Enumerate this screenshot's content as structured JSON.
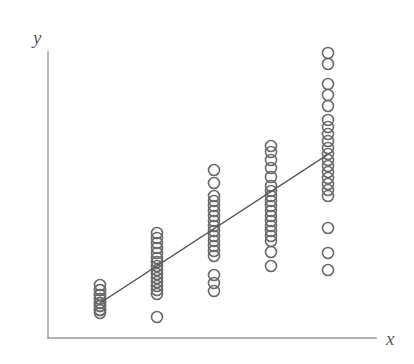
{
  "chart_data": {
    "type": "scatter",
    "title": "",
    "subtitle": "",
    "xlabel": "x",
    "ylabel": "y",
    "grid": false,
    "legend": null,
    "xlim": [
      0,
      6
    ],
    "ylim": [
      0,
      10
    ],
    "axis_ticks": {
      "x": [],
      "y": []
    },
    "marker": {
      "shape": "open-circle",
      "diameter_px": 11,
      "stroke_color": "#6b6b6b",
      "stroke_width_px": 1.6,
      "fill": "none"
    },
    "series": [
      {
        "name": "observations",
        "note": "Five vertical clusters of repeated x values with spread in y; many markers overlap.",
        "x": [
          1,
          2,
          3,
          4,
          5
        ],
        "clusters": [
          {
            "x": 1,
            "x_px": 100,
            "count": 14,
            "y_px": [
              285,
              290,
              290,
              295,
              295,
              299,
              299,
              303,
              303,
              306,
              306,
              310,
              310,
              313
            ]
          },
          {
            "x": 2,
            "x_px": 157,
            "count": 16,
            "y_px": [
              233,
              238,
              243,
              248,
              253,
              258,
              262,
              266,
              270,
              274,
              278,
              282,
              286,
              290,
              294,
              317
            ]
          },
          {
            "x": 3,
            "x_px": 214,
            "count": 18,
            "y_px": [
              170,
              183,
              196,
              201,
              206,
              211,
              216,
              221,
              226,
              231,
              236,
              241,
              246,
              251,
              256,
              275,
              283,
              291
            ]
          },
          {
            "x": 4,
            "x_px": 271,
            "count": 19,
            "y_px": [
              146,
              152,
              160,
              168,
              177,
              186,
              191,
              196,
              201,
              206,
              211,
              216,
              221,
              226,
              231,
              236,
              241,
              252,
              266
            ]
          },
          {
            "x": 5,
            "x_px": 328,
            "count": 21,
            "y_px": [
              53,
              64,
              84,
              95,
              106,
              120,
              127,
              134,
              141,
              148,
              154,
              160,
              166,
              172,
              178,
              184,
              190,
              196,
              228,
              253,
              270
            ]
          }
        ]
      }
    ],
    "regression_line": {
      "name": "fitted line",
      "color": "#5a5a5a",
      "width_px": 1.4,
      "start_px": [
        100,
        303
      ],
      "end_px": [
        327,
        155
      ]
    },
    "axes": {
      "color": "#9a9a9a",
      "width_px": 1.4,
      "origin_px": [
        48,
        338
      ],
      "y_axis_top_px": [
        48,
        52
      ],
      "x_axis_right_px": [
        376,
        338
      ]
    }
  },
  "figure": {
    "background_color": "#ffffff",
    "axis_label_color": "#5a5a5a"
  }
}
